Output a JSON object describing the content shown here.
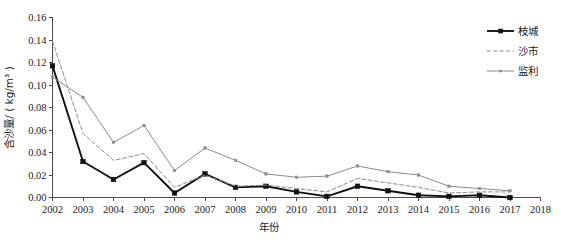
{
  "chart_data": {
    "type": "line",
    "title": "",
    "xlabel": "年份",
    "ylabel": "含沙量/ ( kg/m³ )",
    "xlim": [
      2002,
      2018
    ],
    "ylim": [
      0.0,
      0.16
    ],
    "grid": false,
    "legend_position": "top-right",
    "x": [
      2002,
      2003,
      2004,
      2005,
      2006,
      2007,
      2008,
      2009,
      2010,
      2011,
      2012,
      2013,
      2014,
      2015,
      2016,
      2017
    ],
    "xticks": [
      "2002",
      "2003",
      "2004",
      "2005",
      "2006",
      "2007",
      "2008",
      "2009",
      "2010",
      "2011",
      "2012",
      "2013",
      "2014",
      "2015",
      "2016",
      "2017",
      "2018"
    ],
    "yticks": [
      "0.00",
      "0.02",
      "0.04",
      "0.06",
      "0.08",
      "0.10",
      "0.12",
      "0.14",
      "0.16"
    ],
    "series": [
      {
        "name": "枝城",
        "color": "#111111",
        "style": "solid",
        "marker": "square",
        "values": [
          0.117,
          0.032,
          0.016,
          0.031,
          0.004,
          0.021,
          0.009,
          0.01,
          0.005,
          0.001,
          0.01,
          0.006,
          0.002,
          0.001,
          0.002,
          0.0
        ]
      },
      {
        "name": "沙市",
        "color": "#8c8c8c",
        "style": "dashed",
        "marker": "none",
        "values": [
          0.139,
          0.057,
          0.033,
          0.039,
          0.009,
          0.02,
          0.01,
          0.011,
          0.008,
          0.005,
          0.017,
          0.013,
          0.009,
          0.004,
          0.005,
          0.005
        ]
      },
      {
        "name": "监利",
        "color": "#8c8c8c",
        "style": "solid",
        "marker": "dot",
        "values": [
          0.107,
          0.089,
          0.049,
          0.064,
          0.024,
          0.044,
          0.033,
          0.021,
          0.018,
          0.019,
          0.028,
          0.023,
          0.02,
          0.01,
          0.008,
          0.006
        ]
      }
    ]
  },
  "legend": {
    "entries": [
      {
        "label": "枝城"
      },
      {
        "label": "沙市"
      },
      {
        "label": "监利"
      }
    ]
  },
  "axes": {
    "x_title": "年份",
    "y_title": "含沙量/ ( kg/m³ )"
  }
}
